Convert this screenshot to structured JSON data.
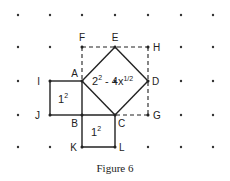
{
  "figure": {
    "caption": "Figure 6",
    "grid": {
      "columns": 7,
      "rows": 5
    },
    "points": {
      "F": [
        2,
        1
      ],
      "E": [
        3,
        1
      ],
      "H": [
        4,
        1
      ],
      "I": [
        1,
        2
      ],
      "A": [
        2,
        2
      ],
      "D": [
        4,
        2
      ],
      "J": [
        1,
        3
      ],
      "B": [
        2,
        3
      ],
      "C": [
        3,
        3
      ],
      "G": [
        4,
        3
      ],
      "K": [
        2,
        4
      ],
      "L": [
        3,
        4
      ]
    },
    "labels": {
      "F": "F",
      "E": "E",
      "H": "H",
      "I": "I",
      "A": "A",
      "D": "D",
      "J": "J",
      "B": "B",
      "C": "C",
      "G": "G",
      "K": "K",
      "L": "L"
    },
    "solid_segments": [
      [
        "I",
        "A"
      ],
      [
        "A",
        "B"
      ],
      [
        "B",
        "J"
      ],
      [
        "J",
        "I"
      ],
      [
        "B",
        "C"
      ],
      [
        "C",
        "L"
      ],
      [
        "L",
        "K"
      ],
      [
        "K",
        "B"
      ],
      [
        "A",
        "E"
      ],
      [
        "E",
        "D"
      ],
      [
        "D",
        "C"
      ],
      [
        "C",
        "A"
      ]
    ],
    "dashed_segments": [
      [
        "F",
        "H"
      ],
      [
        "H",
        "G"
      ],
      [
        "G",
        "C"
      ],
      [
        "F",
        "A"
      ]
    ],
    "area_labels": {
      "upper_left_square": {
        "base": "1",
        "exp": "2"
      },
      "lower_square": {
        "base": "1",
        "exp": "2"
      },
      "tilted_square": {
        "base": "2",
        "exp": "2",
        "rest": " - 4x",
        "frac": "1/2"
      }
    }
  }
}
